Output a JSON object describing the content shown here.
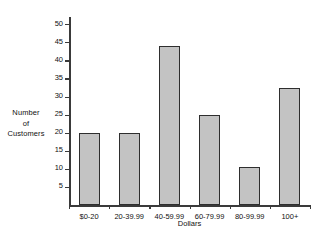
{
  "chart_data": {
    "type": "bar",
    "title": "",
    "categories": [
      "$0-20",
      "20-39.99",
      "40-59.99",
      "60-79.99",
      "80-99.99",
      "100+"
    ],
    "values": [
      20,
      20,
      44,
      25,
      10.5,
      32.5
    ],
    "xlabel": "Dollars",
    "ylabel": "Number of Customers",
    "ylabel_lines": [
      "Number",
      "of",
      "Customers"
    ],
    "ylim": [
      0,
      52
    ],
    "yticks": [
      5,
      10,
      15,
      20,
      25,
      30,
      35,
      40,
      45,
      50
    ],
    "ytick_labels": [
      "5",
      "10",
      "15",
      "20",
      "25",
      "30",
      "35",
      "40",
      "45",
      "50"
    ],
    "grid": false,
    "legend": null,
    "colors": {
      "bar_fill": "#c3c3c3",
      "bar_edge": "#2e2e2e",
      "axis": "#3a3a3a",
      "text": "#111111",
      "background": "#ffffff"
    }
  }
}
